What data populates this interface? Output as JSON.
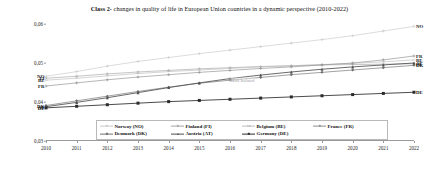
{
  "title": {
    "lead": "Class 2-",
    "rest": " changes in quality of life in European Union countries in a dynamic perspective (2010-2022)",
    "full": "Class 2- changes in quality of life in European Union countries in a dynamic perspective (2010-2022)"
  },
  "annotation": {
    "text": "Most Isolated"
  },
  "chart_data": {
    "type": "line",
    "title": "Class 2- changes in quality of life in European Union countries in a dynamic perspective (2010-2022)",
    "xlabel": "",
    "ylabel": "",
    "x": [
      2010,
      2011,
      2012,
      2013,
      2014,
      2015,
      2016,
      2017,
      2018,
      2019,
      2020,
      2021,
      2022
    ],
    "categories": [
      "2010",
      "2011",
      "2012",
      "2013",
      "2014",
      "2015",
      "2016",
      "2017",
      "2018",
      "2019",
      "2020",
      "2021",
      "2022"
    ],
    "xlim": [
      2010,
      2022
    ],
    "ylim": [
      0.03,
      0.06
    ],
    "yticks": [
      0.03,
      0.04,
      0.05,
      0.06
    ],
    "ytick_labels": [
      "0,03",
      "0,04",
      "0,05",
      "0,06"
    ],
    "grid": false,
    "legend_position": "bottom",
    "series": [
      {
        "name": "Norway (NO)",
        "code": "NO",
        "color": "#c9c9c9",
        "marker": "cross",
        "values": [
          0.0466,
          0.0478,
          0.0492,
          0.0504,
          0.0514,
          0.0524,
          0.0533,
          0.0542,
          0.0551,
          0.056,
          0.057,
          0.0582,
          0.0594
        ]
      },
      {
        "name": "Finland (FI)",
        "code": "FI",
        "color": "#a6a6a6",
        "marker": "plus",
        "values": [
          0.0461,
          0.0466,
          0.0472,
          0.0477,
          0.0481,
          0.0485,
          0.0488,
          0.0491,
          0.0493,
          0.0495,
          0.0496,
          0.0497,
          0.0498
        ]
      },
      {
        "name": "Belgium (BE)",
        "code": "BE",
        "color": "#bdbdbd",
        "marker": "dash",
        "values": [
          0.0456,
          0.0461,
          0.0467,
          0.0473,
          0.0478,
          0.0482,
          0.0486,
          0.049,
          0.0493,
          0.0496,
          0.0499,
          0.0503,
          0.0508
        ]
      },
      {
        "name": "France (FR)",
        "code": "FR",
        "color": "#8e8e8e",
        "marker": "plus",
        "values": [
          0.0441,
          0.0449,
          0.0457,
          0.0464,
          0.047,
          0.0476,
          0.0481,
          0.0486,
          0.049,
          0.0495,
          0.05,
          0.0508,
          0.0518
        ]
      },
      {
        "name": "Denmark (DK)",
        "code": "DK",
        "color": "#6e6e6e",
        "marker": "diamond",
        "values": [
          0.0391,
          0.0403,
          0.0415,
          0.0427,
          0.0438,
          0.0448,
          0.0456,
          0.0463,
          0.047,
          0.0476,
          0.0482,
          0.0488,
          0.0494
        ]
      },
      {
        "name": "Austria (AT)",
        "code": "AT",
        "color": "#4f4f4f",
        "marker": "triangle",
        "values": [
          0.0388,
          0.0399,
          0.0411,
          0.0424,
          0.0437,
          0.0449,
          0.046,
          0.0469,
          0.0477,
          0.0484,
          0.049,
          0.0495,
          0.05
        ]
      },
      {
        "name": "Germany (DE)",
        "code": "DE",
        "color": "#2b2b2b",
        "marker": "square",
        "values": [
          0.0385,
          0.0389,
          0.0393,
          0.0397,
          0.0401,
          0.0404,
          0.0407,
          0.041,
          0.0413,
          0.0416,
          0.0419,
          0.0422,
          0.0425
        ]
      }
    ]
  },
  "left_labels": [
    {
      "code": "NO",
      "value": 0.0466
    },
    {
      "code": "FI",
      "value": 0.0461
    },
    {
      "code": "BE",
      "value": 0.0456
    },
    {
      "code": "FR",
      "value": 0.0441
    },
    {
      "code": "DK",
      "value": 0.0391
    },
    {
      "code": "AT",
      "value": 0.0388
    },
    {
      "code": "DE",
      "value": 0.0385
    }
  ],
  "right_labels": [
    {
      "code": "NO",
      "value": 0.0594
    },
    {
      "code": "FR",
      "value": 0.0518
    },
    {
      "code": "BE",
      "value": 0.0508
    },
    {
      "code": "FI",
      "value": 0.0498
    },
    {
      "code": "AT",
      "value": 0.05
    },
    {
      "code": "DK",
      "value": 0.0494
    },
    {
      "code": "DE",
      "value": 0.0425
    }
  ]
}
